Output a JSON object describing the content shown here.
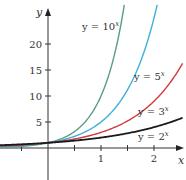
{
  "chart_data": {
    "type": "line",
    "title": "",
    "xlabel": "x",
    "ylabel": "y",
    "xlim": [
      -1.0,
      2.55
    ],
    "ylim": [
      -4,
      28
    ],
    "grid": false,
    "legend_position": "inline labels",
    "x_ticks": [
      -0.5,
      0.5,
      1,
      1.5,
      2
    ],
    "x_tick_labels": [
      "",
      "",
      "1",
      "",
      "2"
    ],
    "y_ticks": [
      5,
      10,
      15,
      20
    ],
    "y_tick_labels": [
      "5",
      "10",
      "15",
      "20"
    ],
    "series": [
      {
        "name": "y = 10^x",
        "label_base": "y = 10",
        "label_exp": "x",
        "base": 10,
        "color": "#5a9e7f",
        "x": [
          -1,
          -0.5,
          0,
          0.5,
          1,
          1.25,
          1.45
        ],
        "values": [
          0.1,
          0.32,
          1,
          3.16,
          10,
          17.8,
          28.2
        ]
      },
      {
        "name": "y = 5^x",
        "label_base": "y = 5",
        "label_exp": "x",
        "base": 5,
        "color": "#3fb0dd",
        "x": [
          -1,
          -0.5,
          0,
          0.5,
          1,
          1.5,
          2,
          2.07
        ],
        "values": [
          0.2,
          0.45,
          1,
          2.24,
          5,
          11.2,
          25,
          28
        ]
      },
      {
        "name": "y = 3^x",
        "label_base": "y = 3",
        "label_exp": "x",
        "base": 3,
        "color": "#d23b3b",
        "x": [
          -1,
          -0.5,
          0,
          0.5,
          1,
          1.5,
          2,
          2.55
        ],
        "values": [
          0.33,
          0.58,
          1,
          1.73,
          3,
          5.2,
          9,
          16.4
        ]
      },
      {
        "name": "y = 2^x",
        "label_base": "y = 2",
        "label_exp": "x",
        "base": 2,
        "color": "#1a1a1a",
        "x": [
          -1,
          -0.5,
          0,
          0.5,
          1,
          1.5,
          2,
          2.55
        ],
        "values": [
          0.5,
          0.71,
          1,
          1.41,
          2,
          2.83,
          4,
          5.86
        ]
      }
    ]
  }
}
